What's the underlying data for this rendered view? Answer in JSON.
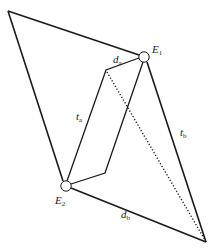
{
  "diagram": {
    "nodes": {
      "top_left": {
        "x": 8,
        "y": 11
      },
      "E1": {
        "x": 144,
        "y": 57,
        "label": "E",
        "sub": "1"
      },
      "E2": {
        "x": 66,
        "y": 186,
        "label": "E",
        "sub": "2"
      },
      "bottom_right": {
        "x": 206,
        "y": 242
      },
      "inner_top": {
        "x": 106,
        "y": 70
      },
      "inner_bottom": {
        "x": 105,
        "y": 173
      }
    },
    "edge_labels": {
      "d_a": {
        "main": "d",
        "sub": "a"
      },
      "t_a": {
        "main": "t",
        "sub": "a"
      },
      "t_b": {
        "main": "t",
        "sub": "b"
      },
      "d_b": {
        "main": "d",
        "sub": "b"
      }
    },
    "colors": {
      "line": "#1a1a1a",
      "node_fill": "#ffffff"
    }
  }
}
